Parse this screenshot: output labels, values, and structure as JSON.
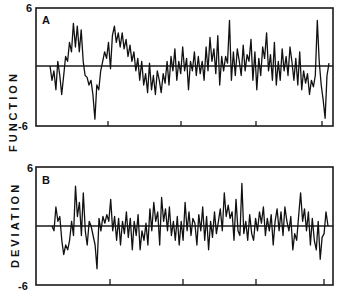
{
  "chart_data": [
    {
      "type": "line",
      "panel_label": "A",
      "title": "",
      "xlabel": "",
      "ylabel": "FUNCTION",
      "ylim": [
        -6,
        6
      ],
      "ytick_labels": [
        "6",
        "-6"
      ],
      "zero_line": true,
      "grid": false,
      "legend": null,
      "x_ticks_count": 4,
      "x": [
        0,
        1,
        2,
        3,
        4,
        5,
        6,
        7,
        8,
        9,
        10,
        11,
        12,
        13,
        14,
        15,
        16,
        17,
        18,
        19,
        20,
        21,
        22,
        23,
        24,
        25,
        26,
        27,
        28,
        29,
        30,
        31,
        32,
        33,
        34,
        35,
        36,
        37,
        38,
        39,
        40,
        41,
        42,
        43,
        44,
        45,
        46,
        47,
        48,
        49,
        50,
        51,
        52,
        53,
        54,
        55,
        56,
        57,
        58,
        59,
        60,
        61,
        62,
        63,
        64,
        65,
        66,
        67,
        68,
        69,
        70,
        71,
        72,
        73,
        74,
        75,
        76,
        77,
        78,
        79,
        80,
        81,
        82,
        83,
        84,
        85,
        86,
        87,
        88,
        89,
        90,
        91,
        92,
        93,
        94,
        95,
        96,
        97,
        98,
        99,
        100,
        101,
        102,
        103,
        104,
        105,
        106,
        107,
        108,
        109,
        110,
        111,
        112,
        113,
        114,
        115,
        116,
        117,
        118,
        119,
        120,
        121,
        122,
        123,
        124,
        125,
        126,
        127,
        128,
        129,
        130,
        131,
        132,
        133,
        134,
        135,
        136,
        137,
        138,
        139
      ],
      "values": [
        0,
        -1.5,
        -0.5,
        -2.5,
        0.5,
        -1,
        -3,
        -1,
        1,
        0.5,
        2.5,
        1.5,
        4.5,
        2,
        4.2,
        1.5,
        3.8,
        0.5,
        -1,
        -1.2,
        -2,
        -1.5,
        -3,
        -5.6,
        -2,
        -2.5,
        -0.5,
        0.5,
        1.5,
        0.8,
        2.5,
        -0.3,
        3.2,
        4.2,
        2.5,
        3.5,
        2,
        3.5,
        1.8,
        2.8,
        1,
        2.2,
        0.5,
        1.5,
        -0.5,
        0.8,
        -1.5,
        0.5,
        -2,
        -0.8,
        -2.8,
        0.3,
        -2.5,
        -1,
        -3,
        -0.5,
        -1.5,
        -2.8,
        -0.8,
        -1.8,
        0.5,
        -2,
        1,
        -0.5,
        1.8,
        -1.5,
        0.5,
        -0.8,
        2,
        -0.5,
        0.8,
        -2.5,
        0.5,
        -0.5,
        1.5,
        -1,
        1,
        -0.8,
        0.5,
        -1.5,
        2,
        -0.5,
        3,
        0.5,
        1.8,
        -0.8,
        3.2,
        -2,
        1,
        -0.5,
        1,
        0.3,
        4.8,
        -1.5,
        1.5,
        -1,
        1.8,
        0.5,
        -1,
        2.2,
        -0.5,
        1.2,
        0.5,
        2.8,
        -1.5,
        1.5,
        -2.5,
        0.8,
        -1,
        2,
        0.8,
        3.5,
        -0.5,
        1.2,
        -1.5,
        2.5,
        -2,
        0.5,
        -1.5,
        1.8,
        -0.5,
        1,
        -1,
        2,
        0.5,
        -1.5,
        0.8,
        -2,
        1.5,
        -2.5,
        -0.5,
        -1.8,
        -0.8,
        -3,
        -1.5,
        -2.2,
        -1,
        4.8,
        0.5,
        -2,
        -3.5,
        -5.5,
        -1,
        0.3
      ],
      "notes": "Trace values approximated from pixel positions; approximately 140 samples spanning the panel width."
    },
    {
      "type": "line",
      "panel_label": "B",
      "title": "",
      "xlabel": "",
      "ylabel": "DEVIATION",
      "ylim": [
        -6,
        6
      ],
      "ytick_labels": [
        "6",
        "-6"
      ],
      "zero_line": true,
      "grid": false,
      "legend": null,
      "x_ticks_count": 4,
      "x": [
        0,
        1,
        2,
        3,
        4,
        5,
        6,
        7,
        8,
        9,
        10,
        11,
        12,
        13,
        14,
        15,
        16,
        17,
        18,
        19,
        20,
        21,
        22,
        23,
        24,
        25,
        26,
        27,
        28,
        29,
        30,
        31,
        32,
        33,
        34,
        35,
        36,
        37,
        38,
        39,
        40,
        41,
        42,
        43,
        44,
        45,
        46,
        47,
        48,
        49,
        50,
        51,
        52,
        53,
        54,
        55,
        56,
        57,
        58,
        59,
        60,
        61,
        62,
        63,
        64,
        65,
        66,
        67,
        68,
        69,
        70,
        71,
        72,
        73,
        74,
        75,
        76,
        77,
        78,
        79,
        80,
        81,
        82,
        83,
        84,
        85,
        86,
        87,
        88,
        89,
        90,
        91,
        92,
        93,
        94,
        95,
        96,
        97,
        98,
        99,
        100,
        101,
        102,
        103,
        104,
        105,
        106,
        107,
        108,
        109,
        110,
        111,
        112,
        113,
        114,
        115,
        116,
        117,
        118,
        119,
        120,
        121,
        122,
        123,
        124,
        125,
        126,
        127,
        128,
        129,
        130,
        131,
        132,
        133,
        134,
        135,
        136,
        137,
        138,
        139
      ],
      "values": [
        0,
        -0.5,
        2,
        0.5,
        1,
        -1.5,
        -3,
        -2,
        -2.5,
        -1.5,
        0.5,
        -1,
        4.2,
        1,
        2.5,
        -1,
        3.5,
        -0.5,
        -2,
        0.5,
        0,
        -1,
        -2,
        -4.5,
        0.8,
        -0.5,
        1,
        0.3,
        1.2,
        0.5,
        2.8,
        -0.5,
        1,
        -1.5,
        0.8,
        -2,
        0.5,
        -0.8,
        1.5,
        -1.2,
        0.8,
        -2.5,
        0.5,
        -1,
        1.2,
        -2.5,
        -0.5,
        -1.5,
        0.3,
        -2,
        1.8,
        -0.5,
        2.5,
        0.5,
        1.5,
        -2,
        3,
        0.5,
        1.8,
        -0.5,
        2,
        -1,
        0.5,
        -1.5,
        1,
        -2,
        0.5,
        -1.5,
        2.5,
        -0.5,
        1.5,
        -1,
        0.8,
        0.3,
        -2,
        1.2,
        -0.5,
        2,
        -1.5,
        1,
        -2.5,
        0.5,
        -1.2,
        1.5,
        -0.8,
        0.5,
        1.8,
        -0.5,
        3.5,
        1,
        2.2,
        0.8,
        1.5,
        -1.5,
        2.8,
        -0.5,
        -1,
        4.5,
        -0.8,
        0.5,
        -1.5,
        1.2,
        -0.8,
        -1.5,
        0.8,
        -0.5,
        1.5,
        0.3,
        2,
        -1,
        0.8,
        -0.5,
        1.2,
        -2,
        0.5,
        1.8,
        -0.5,
        1.5,
        -1,
        2,
        0.5,
        -0.5,
        1,
        -2.5,
        -0.8,
        -1.5,
        1,
        3.5,
        0.5,
        1.8,
        -0.5,
        1.5,
        -2,
        0.8,
        -1.5,
        -2.5,
        0.5,
        -3.5,
        -1.2,
        -0.8,
        1.5,
        0
      ],
      "notes": "Trace values approximated from pixel positions; approximately 140 samples spanning the panel width."
    }
  ],
  "panels": {
    "a": {
      "label": "A",
      "y_max_label": "6",
      "y_min_label": "-6",
      "axis_title": "FUNCTION"
    },
    "b": {
      "label": "B",
      "y_max_label": "6",
      "y_min_label": "-6",
      "axis_title": "DEVIATION"
    }
  },
  "colors": {
    "ink": "#111111",
    "background": "#ffffff"
  }
}
